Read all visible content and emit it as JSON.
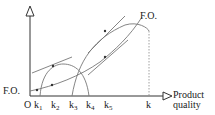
{
  "diagram": {
    "y_axis_label": "",
    "x_axis_label_line1": "Product",
    "x_axis_label_line2": "quality",
    "origin_label": "O",
    "left_curve_label": "F.O.",
    "top_curve_label": "F.O.",
    "ticks": [
      {
        "label": "k",
        "sub": "1"
      },
      {
        "label": "k",
        "sub": "2"
      },
      {
        "label": "k",
        "sub": "3"
      },
      {
        "label": "k",
        "sub": "4"
      },
      {
        "label": "k",
        "sub": "5"
      },
      {
        "label": "k",
        "sub": ""
      }
    ]
  }
}
